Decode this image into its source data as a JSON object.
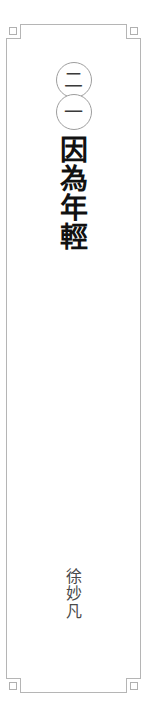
{
  "page": {
    "kind": "book-chapter-title-page",
    "background_color": "#ffffff",
    "writing_mode": "vertical-right-to-left",
    "language": "zh-Hant"
  },
  "frame": {
    "name": "decorative-border",
    "line_color": "#b5b5b5",
    "corner_square_color": "#b0b0b0",
    "style": "stepped-notched-corners-with-small-squares"
  },
  "chapter_number": {
    "label": "二一",
    "reading": "21",
    "circles": [
      {
        "glyph": "二",
        "value": "2"
      },
      {
        "glyph": "一",
        "value": "1"
      }
    ],
    "circle_border_color": "#9e9e9e",
    "text_color": "#3a3a3a"
  },
  "title": {
    "full_text": "因為年輕",
    "chars": [
      "因",
      "為",
      "年",
      "輕"
    ],
    "color": "#111111"
  },
  "author": {
    "full_text": "徐妙凡",
    "chars": [
      "徐",
      "妙",
      "凡"
    ],
    "color": "#4a4a4a"
  }
}
